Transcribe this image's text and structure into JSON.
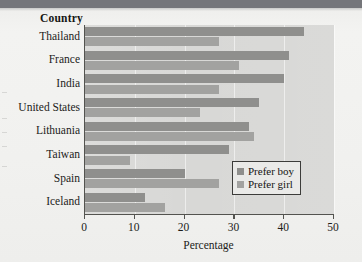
{
  "chart_data": {
    "type": "bar",
    "orientation": "horizontal",
    "title": "",
    "xlabel": "Percentage",
    "ylabel": "Country",
    "xlim": [
      0,
      50
    ],
    "xticks": [
      0,
      10,
      20,
      30,
      40,
      50
    ],
    "grid": true,
    "legend_position": "inside-lower-right",
    "categories": [
      "Thailand",
      "France",
      "India",
      "United States",
      "Lithuania",
      "Taiwan",
      "Spain",
      "Iceland"
    ],
    "series": [
      {
        "name": "Prefer boy",
        "color": "#8f8f8d",
        "values": [
          44,
          41,
          40,
          35,
          33,
          29,
          20,
          12
        ]
      },
      {
        "name": "Prefer girl",
        "color": "#a2a2a0",
        "values": [
          27,
          31,
          27,
          23,
          34,
          9,
          27,
          16
        ]
      }
    ]
  },
  "axes": {
    "y_title": "Country",
    "x_title": "Percentage",
    "x_tick_labels": [
      "0",
      "10",
      "20",
      "30",
      "40",
      "50"
    ]
  },
  "legend": {
    "items": [
      {
        "label": "Prefer boy",
        "swatch": "boy"
      },
      {
        "label": "Prefer girl",
        "swatch": "girl"
      }
    ]
  },
  "colors": {
    "prefer_boy": "#8f8f8d",
    "prefer_girl": "#a2a2a0",
    "plot_background": "#d8d8d6",
    "page_background": "#f2f2f0",
    "axis": "#53534f"
  }
}
